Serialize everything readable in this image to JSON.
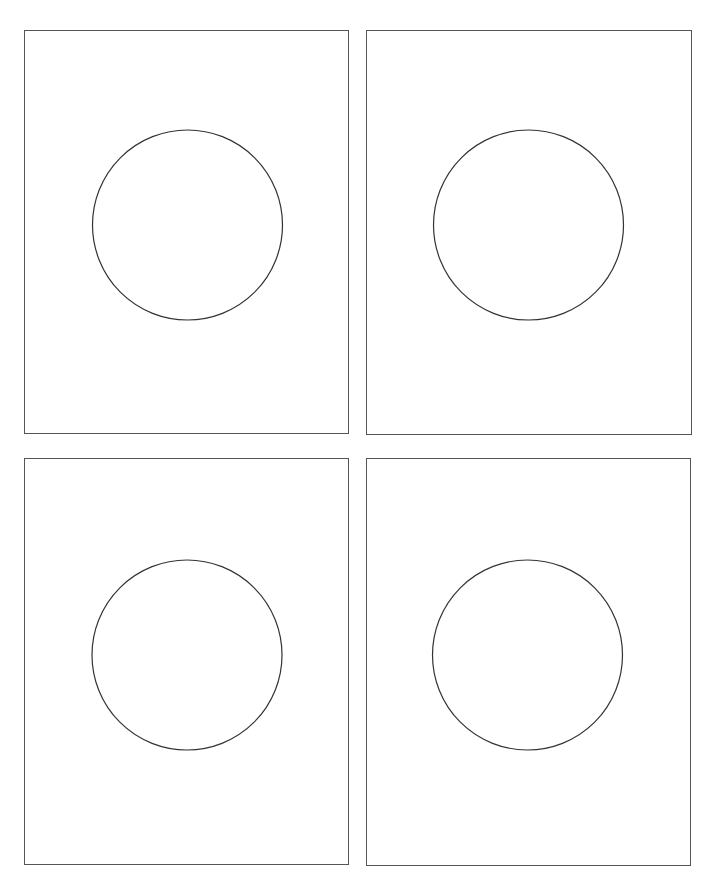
{
  "canvas": {
    "width": 712,
    "height": 869,
    "background": "#ffffff"
  },
  "style": {
    "panel_border_color": "#555555",
    "circle_stroke_color": "#333333",
    "circle_stroke_width": 1.2
  },
  "panels": [
    {
      "id": "top-left",
      "x": 24,
      "y": 30,
      "width": 325,
      "height": 404,
      "circle": {
        "cx": 187.5,
        "cy": 225,
        "r": 95
      }
    },
    {
      "id": "top-right",
      "x": 366,
      "y": 30,
      "width": 326,
      "height": 405,
      "circle": {
        "cx": 528.5,
        "cy": 225,
        "r": 95
      }
    },
    {
      "id": "bottom-left",
      "x": 24,
      "y": 458,
      "width": 325,
      "height": 407,
      "circle": {
        "cx": 187,
        "cy": 655,
        "r": 95
      }
    },
    {
      "id": "bottom-right",
      "x": 366,
      "y": 458,
      "width": 325,
      "height": 408,
      "circle": {
        "cx": 527.5,
        "cy": 655,
        "r": 95
      }
    }
  ]
}
